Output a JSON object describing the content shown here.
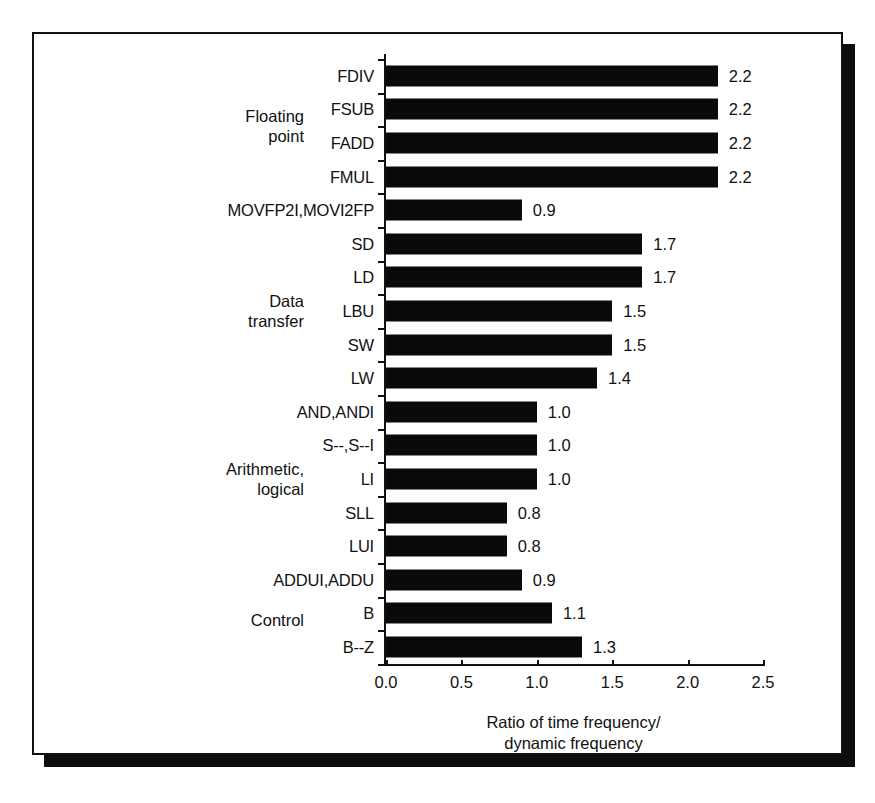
{
  "chart_data": {
    "type": "bar",
    "orientation": "horizontal",
    "title": "",
    "xlabel": "Ratio of time frequency/\ndynamic frequency",
    "ylabel": "",
    "xlim": [
      0.0,
      2.5
    ],
    "xticks": [
      "0.0",
      "0.5",
      "1.0",
      "1.5",
      "2.0",
      "2.5"
    ],
    "grid": false,
    "legend": null,
    "categories": [
      "FDIV",
      "FSUB",
      "FADD",
      "FMUL",
      "MOVFP2I,MOVI2FP",
      "SD",
      "LD",
      "LBU",
      "SW",
      "LW",
      "AND,ANDI",
      "S--,S--I",
      "LI",
      "SLL",
      "LUI",
      "ADDUI,ADDU",
      "B",
      "B--Z"
    ],
    "values": [
      2.2,
      2.2,
      2.2,
      2.2,
      0.9,
      1.7,
      1.7,
      1.5,
      1.5,
      1.4,
      1.0,
      1.0,
      1.0,
      0.8,
      0.8,
      0.9,
      1.1,
      1.3
    ],
    "value_labels": [
      "2.2",
      "2.2",
      "2.2",
      "2.2",
      "0.9",
      "1.7",
      "1.7",
      "1.5",
      "1.5",
      "1.4",
      "1.0",
      "1.0",
      "1.0",
      "0.8",
      "0.8",
      "0.9",
      "1.1",
      "1.3"
    ],
    "groups": [
      {
        "label": "Floating\npoint",
        "first": 0,
        "last": 3
      },
      {
        "label": "Data\ntransfer",
        "first": 5,
        "last": 9
      },
      {
        "label": "Arithmetic,\nlogical",
        "first": 10,
        "last": 14
      },
      {
        "label": "Control",
        "first": 16,
        "last": 17
      }
    ],
    "bar_color": "#0a0a0a",
    "background_color": "#ffffff"
  }
}
